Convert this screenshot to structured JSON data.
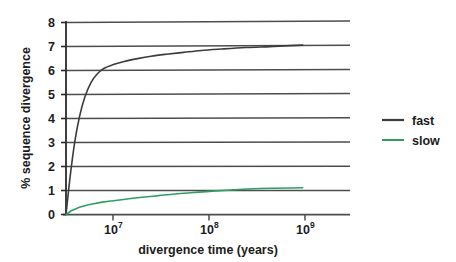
{
  "chart_data": {
    "type": "line",
    "title": "",
    "xlabel": "divergence time (years)",
    "ylabel": "% sequence divergence",
    "xscale": "log",
    "yscale": "linear",
    "xlim": [
      3160000,
      3160000000
    ],
    "ylim": [
      0,
      8
    ],
    "grid": "horizontal",
    "legend_position": "right",
    "y_ticks": [
      "0",
      "1",
      "2",
      "3",
      "4",
      "5",
      "6",
      "7",
      "8"
    ],
    "y_tick_values": [
      0,
      1,
      2,
      3,
      4,
      5,
      6,
      7,
      8
    ],
    "x_ticks": [
      {
        "base": "10",
        "exponent": "7",
        "value": 10000000
      },
      {
        "base": "10",
        "exponent": "8",
        "value": 100000000
      },
      {
        "base": "10",
        "exponent": "9",
        "value": 1000000000
      }
    ],
    "series": [
      {
        "name": "fast",
        "color": "#3b3b3b",
        "x": [
          3160000,
          3500000,
          3900000,
          4400000,
          5000000,
          5800000,
          6700000,
          8000000,
          10000000,
          13000000,
          18000000,
          25000000,
          36000000,
          55000000,
          85000000,
          140000000,
          250000000,
          450000000,
          750000000,
          1000000000
        ],
        "y": [
          0.0,
          1.6,
          3.0,
          4.1,
          4.9,
          5.5,
          5.85,
          6.1,
          6.25,
          6.38,
          6.5,
          6.6,
          6.68,
          6.76,
          6.84,
          6.9,
          6.96,
          7.0,
          7.04,
          7.06
        ]
      },
      {
        "name": "slow",
        "color": "#2e9e63",
        "x": [
          3160000,
          3600000,
          4200000,
          5000000,
          6200000,
          8000000,
          10000000,
          14000000,
          20000000,
          30000000,
          45000000,
          70000000,
          110000000,
          180000000,
          300000000,
          500000000,
          750000000,
          1000000000
        ],
        "y": [
          0.0,
          0.16,
          0.28,
          0.37,
          0.45,
          0.53,
          0.58,
          0.65,
          0.72,
          0.79,
          0.86,
          0.92,
          0.98,
          1.03,
          1.08,
          1.1,
          1.11,
          1.12
        ]
      }
    ],
    "legend": [
      {
        "label": "fast",
        "color": "#3b3b3b"
      },
      {
        "label": "slow",
        "color": "#2e9e63"
      }
    ]
  },
  "colors": {
    "fast": "#3b3b3b",
    "slow": "#2e9e63",
    "gridline": "#4d4d4d",
    "axis": "#2b2b2b",
    "background": "#ffffff"
  }
}
